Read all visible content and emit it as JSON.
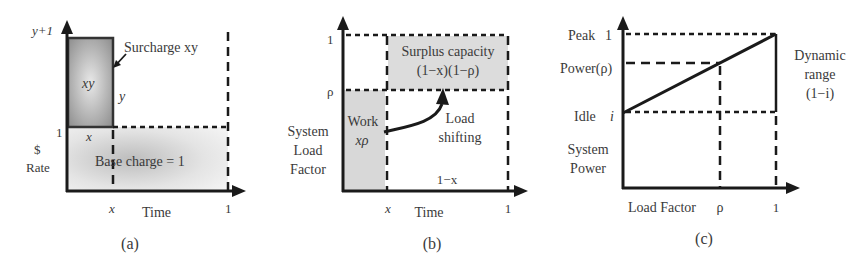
{
  "panels": {
    "a": {
      "caption": "(a)",
      "y_top_label": "y+1",
      "y_one_label": "1",
      "y_axis_label_line1": "$",
      "y_axis_label_line2": "Rate",
      "x_label": "Time",
      "x_tick_x": "x",
      "x_tick_one": "1",
      "surcharge_label": "Surcharge xy",
      "surcharge_area": "xy",
      "surcharge_height": "y",
      "surcharge_width": "x",
      "base_label": "Base charge = 1"
    },
    "b": {
      "caption": "(b)",
      "y_tick_one": "1",
      "y_tick_rho": "ρ",
      "y_axis_label_line1": "System",
      "y_axis_label_line2": "Load",
      "y_axis_label_line3": "Factor",
      "x_label": "Time",
      "x_tick_x": "x",
      "x_tick_one": "1",
      "surplus_line1": "Surplus capacity",
      "surplus_line2": "(1−x)(1−ρ)",
      "work_line1": "Work",
      "work_line2": "xρ",
      "shift_line1": "Load",
      "shift_line2": "shifting",
      "width_label": "1−x"
    },
    "c": {
      "caption": "(c)",
      "peak_label": "Peak",
      "peak_value": "1",
      "power_rho_label": "Power(ρ)",
      "idle_label": "Idle",
      "idle_value": "i",
      "y_axis_label_line1": "System",
      "y_axis_label_line2": "Power",
      "x_label": "Load Factor",
      "x_tick_rho": "ρ",
      "x_tick_one": "1",
      "dyn_line1": "Dynamic",
      "dyn_line2": "range",
      "dyn_line3": "(1−i)"
    }
  },
  "colors": {
    "axis": "#1a1a1a",
    "text": "#3a3a3a",
    "shade_dark": "#9a9a9a",
    "shade_light": "#e2e2e2"
  }
}
